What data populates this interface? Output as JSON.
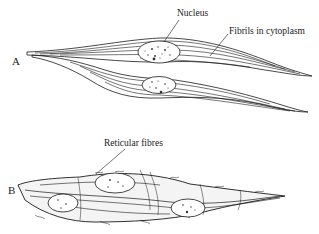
{
  "figure": {
    "panel_a": {
      "letter": "A",
      "labels": {
        "nucleus": "Nucleus",
        "fibrils": "Fibrils in cytoplasm"
      }
    },
    "panel_b": {
      "letter": "B",
      "labels": {
        "reticular": "Reticular fibres"
      }
    },
    "colors": {
      "ink": "#1a1a1a",
      "background": "#ffffff"
    }
  }
}
